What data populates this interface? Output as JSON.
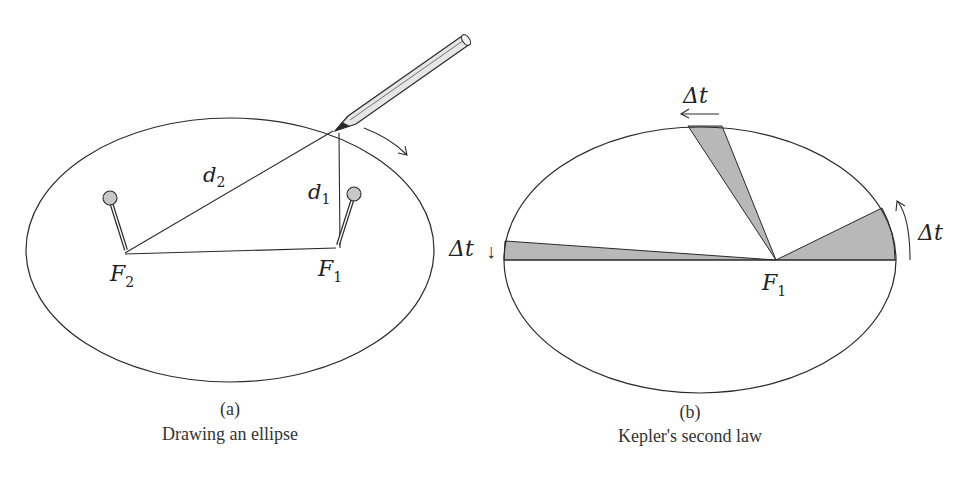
{
  "panel_a": {
    "label": "(a)",
    "caption": "Drawing an ellipse",
    "focus_left": "F",
    "focus_left_sub": "2",
    "focus_right": "F",
    "focus_right_sub": "1",
    "distance_1": "d",
    "distance_1_sub": "1",
    "distance_2": "d",
    "distance_2_sub": "2"
  },
  "panel_b": {
    "label": "(b)",
    "caption": "Kepler's second law",
    "focus": "F",
    "focus_sub": "1",
    "interval_top": "Δt",
    "interval_left": "Δt",
    "interval_right": "Δt",
    "arrow_left": "↓"
  },
  "colors": {
    "line": "#2a2a2a",
    "sector_fill": "#b8b8b8",
    "pin_head": "#c8c8c8"
  }
}
